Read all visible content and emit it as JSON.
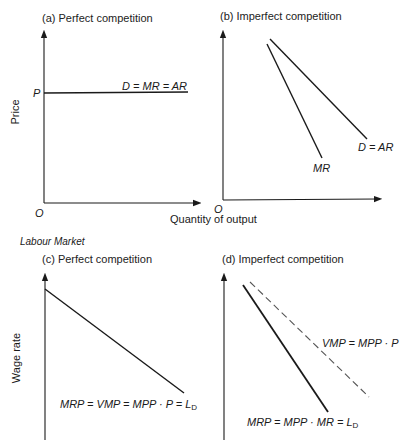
{
  "panels": {
    "a": {
      "title": "(a) Perfect competition",
      "y_label": "Price",
      "price_tick": "P",
      "origin": "O",
      "curve_label": "D = MR = AR"
    },
    "b": {
      "title": "(b) Imperfect competition",
      "origin": "O",
      "demand_label": "D = AR",
      "mr_label": "MR"
    },
    "c": {
      "title": "(c) Perfect competition",
      "y_label": "Wage rate",
      "curve_label": "MRP = VMP = MPP · P = L",
      "curve_label_sub": "D"
    },
    "d": {
      "title": "(d) Imperfect competition",
      "vmp_label": "VMP = MPP · P",
      "mrp_label": "MRP = MPP · MR = L",
      "mrp_label_sub": "D"
    }
  },
  "shared": {
    "x_label_top": "Quantity of output",
    "section_label": "Labour Market"
  },
  "colors": {
    "line": "#1a1a1a",
    "dashed": "#555555"
  }
}
